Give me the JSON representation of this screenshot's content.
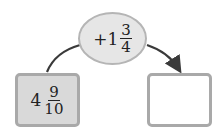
{
  "operation": {
    "sign": "+",
    "whole": "1",
    "numerator": "3",
    "denominator": "4"
  },
  "start": {
    "whole": "4",
    "numerator": "9",
    "denominator": "10"
  },
  "result": {
    "value": ""
  },
  "colors": {
    "oval_fill": "#e6e6e6",
    "box_fill": "#d9d9d9",
    "border": "#a9a9a9",
    "arrow": "#3a3a3a"
  }
}
